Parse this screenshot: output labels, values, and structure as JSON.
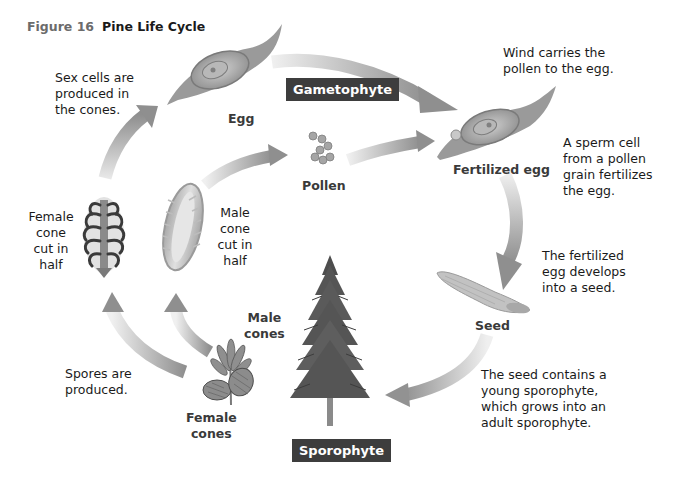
{
  "figure": {
    "number_label": "Figure 16",
    "title": "Pine Life Cycle"
  },
  "stages": {
    "gametophyte": "Gametophyte",
    "sporophyte": "Sporophyte"
  },
  "labels": {
    "egg": "Egg",
    "pollen": "Pollen",
    "fertilized_egg": "Fertilized egg",
    "seed": "Seed",
    "male_cones": [
      "Male",
      "cones"
    ],
    "female_cones": [
      "Female",
      "cones"
    ],
    "female_cone_cut": [
      "Female",
      "cone",
      "cut in",
      "half"
    ],
    "male_cone_cut": [
      "Male",
      "cone",
      "cut in",
      "half"
    ]
  },
  "captions": {
    "sex_cells": [
      "Sex cells are",
      "produced in",
      "the cones."
    ],
    "wind": [
      "Wind carries the",
      "pollen to the egg."
    ],
    "sperm": [
      "A sperm cell",
      "from a pollen",
      "grain fertilizes",
      "the egg."
    ],
    "fertilized_develops": [
      "The fertilized",
      "egg develops",
      "into a seed."
    ],
    "seed_contains": [
      "The seed contains a",
      "young sporophyte,",
      "which grows into an",
      "adult sporophyte."
    ],
    "spores": [
      "Spores are",
      "produced."
    ]
  },
  "colors": {
    "stage_box": "#3d3d3d",
    "stage_text": "#ffffff",
    "arrow": "#9a9a9a",
    "figure_number": "#6b6b6b",
    "label": "#3a3a3a"
  }
}
